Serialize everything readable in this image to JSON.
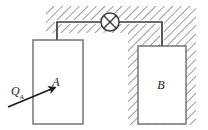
{
  "figure": {
    "background_color": "#ffffff",
    "line_color": "#3b3b3b",
    "hatch_color": "#7a7a7a",
    "text_color": "#1a1a1a"
  },
  "labels": {
    "box_a": "A",
    "box_b": "B",
    "heat_input": "Q",
    "heat_input_subscript": "A"
  },
  "icons": {
    "lamp": "lamp-icon",
    "heat_arrow": "arrow-icon"
  },
  "geometry": {
    "box_a": {
      "x": 33,
      "y": 40,
      "width": 50,
      "height": 84
    },
    "box_b": {
      "x": 138,
      "y": 46,
      "width": 48,
      "height": 78
    },
    "lamp": {
      "cx": 110,
      "cy": 22,
      "r": 9
    },
    "hatch_upper": {
      "x": 46,
      "y": 6,
      "width": 150,
      "height": 27
    },
    "hatch_lower": {
      "x": 128,
      "y": 33,
      "width": 68,
      "height": 92
    },
    "wire_top_y": 22,
    "wire_left_x": 57,
    "wire_right_x": 162,
    "arrow_start": {
      "x": 8,
      "y": 107
    },
    "arrow_end": {
      "x": 56,
      "y": 87
    }
  }
}
